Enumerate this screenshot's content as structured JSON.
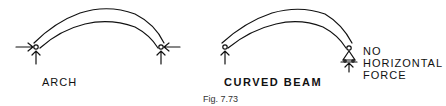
{
  "figure": {
    "caption": "Fig. 7.73",
    "left": {
      "label": "ARCH"
    },
    "right": {
      "label": "CURVED BEAM",
      "note_lines": [
        "NO",
        "HORIZONTAL",
        "FORCE"
      ]
    }
  },
  "colors": {
    "ink": "#111111",
    "background": "#ffffff"
  }
}
